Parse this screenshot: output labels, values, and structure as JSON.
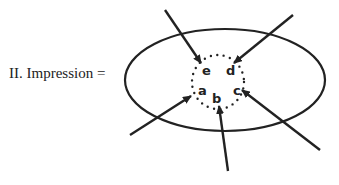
{
  "diagram": {
    "label": "II. Impression =",
    "colors": {
      "ink": "#222222",
      "background": "#ffffff"
    },
    "ellipse": {
      "cx": 225,
      "cy": 80,
      "rx": 100,
      "ry": 51
    },
    "dotted_circle": {
      "cx": 218,
      "cy": 82,
      "rx": 26,
      "ry": 27
    },
    "letters": [
      {
        "id": "e",
        "text": "e",
        "x": 202,
        "y": 75
      },
      {
        "id": "d",
        "text": "d",
        "x": 226,
        "y": 75
      },
      {
        "id": "a",
        "text": "a",
        "x": 198,
        "y": 95
      },
      {
        "id": "b",
        "text": "b",
        "x": 212,
        "y": 103
      },
      {
        "id": "c",
        "text": "c",
        "x": 233,
        "y": 95
      }
    ],
    "arrows": [
      {
        "id": "top-left",
        "x1": 165,
        "y1": 10,
        "x2": 201,
        "y2": 63
      },
      {
        "id": "top-right",
        "x1": 293,
        "y1": 15,
        "x2": 234,
        "y2": 63
      },
      {
        "id": "bottom-left",
        "x1": 130,
        "y1": 135,
        "x2": 191,
        "y2": 96
      },
      {
        "id": "bottom-center",
        "x1": 228,
        "y1": 171,
        "x2": 219,
        "y2": 106
      },
      {
        "id": "bottom-right",
        "x1": 320,
        "y1": 150,
        "x2": 242,
        "y2": 90
      }
    ]
  }
}
